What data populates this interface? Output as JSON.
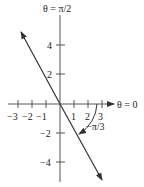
{
  "diagram": {
    "axis_labels": {
      "vertical": "θ = π/2",
      "horizontal": "θ = 0"
    },
    "x_ticks": [
      "−3",
      "−2",
      "−1",
      "1",
      "2",
      "3"
    ],
    "y_ticks": [
      "4",
      "2",
      "−2",
      "−4"
    ],
    "angle_label": "−π/3",
    "colors": {
      "ink": "#333333"
    }
  }
}
